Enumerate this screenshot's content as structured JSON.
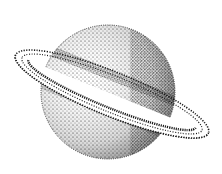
{
  "image": {
    "subject": "ringed planet stipple illustration",
    "colors": {
      "background": "#ffffff",
      "ink": "#1a1a1a"
    }
  }
}
